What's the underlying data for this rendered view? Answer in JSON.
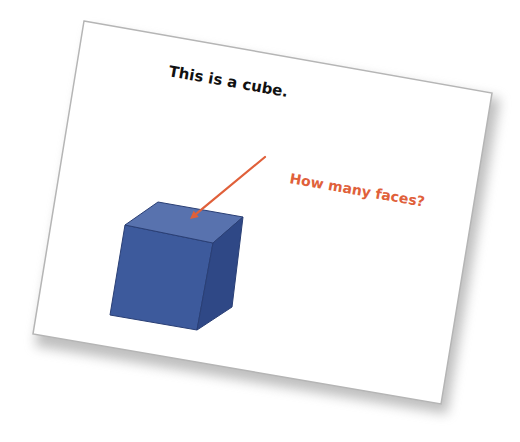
{
  "slide": {
    "corners": {
      "tl": [
        84,
        21
      ],
      "tr": [
        492,
        93
      ],
      "br": [
        441,
        404
      ],
      "bl": [
        33,
        334
      ]
    },
    "fill": "#ffffff",
    "border_color": "#b5b5b5",
    "shadow_color": "#8a8a8a",
    "rotation_deg": 10,
    "title": {
      "text": "This is a cube.",
      "color": "#111111",
      "x": 168,
      "y": 76
    },
    "callout": {
      "text": "How many faces?",
      "color": "#e0603a",
      "x": 289,
      "y": 183
    },
    "arrow": {
      "color": "#e0603a",
      "from": [
        265,
        157
      ],
      "to": [
        190,
        219
      ],
      "width": 2.2
    },
    "cube": {
      "front_face": {
        "points": [
          [
            125,
            225
          ],
          [
            213,
            243
          ],
          [
            197,
            330
          ],
          [
            110,
            315
          ]
        ],
        "color": "#3d5a9c"
      },
      "top_face": {
        "points": [
          [
            158,
            202
          ],
          [
            243,
            217
          ],
          [
            213,
            243
          ],
          [
            125,
            225
          ]
        ],
        "color": "#5872ae"
      },
      "side_face": {
        "points": [
          [
            213,
            243
          ],
          [
            243,
            217
          ],
          [
            232,
            307
          ],
          [
            197,
            330
          ]
        ],
        "color": "#2f4886"
      },
      "edge_color": "#2a3f75"
    }
  }
}
